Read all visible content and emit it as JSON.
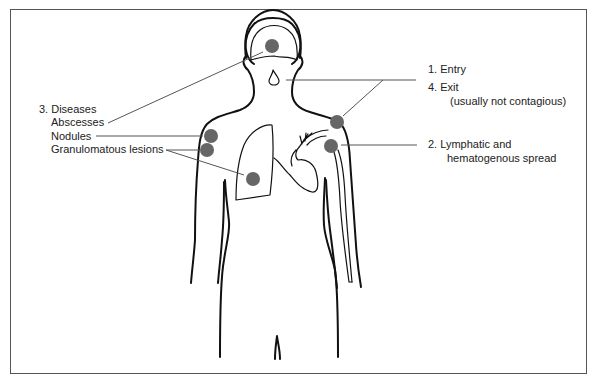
{
  "diagram": {
    "type": "anatomical-infection-route",
    "colors": {
      "lesion": "#666666",
      "outline": "#111111",
      "leader_line": "#555555",
      "frame": "#555555"
    },
    "labels": {
      "entry": "1. Entry",
      "exit": "4. Exit",
      "exit_note": "(usually not contagious)",
      "spread_line1": "2. Lymphatic and",
      "spread_line2": "hematogenous spread",
      "diseases": "3. Diseases",
      "abscesses": "Abscesses",
      "nodules": "Nodules",
      "granulomatous": "Granulomatous lesions"
    },
    "lesion_sites": [
      {
        "name": "brain",
        "x": 272,
        "y": 46
      },
      {
        "name": "right-shoulder-skin",
        "x": 337,
        "y": 122
      },
      {
        "name": "lymph-node",
        "x": 331,
        "y": 146
      },
      {
        "name": "left-shoulder-nodule",
        "x": 211,
        "y": 136
      },
      {
        "name": "left-arm-lesion",
        "x": 207,
        "y": 150
      },
      {
        "name": "lung",
        "x": 253,
        "y": 179
      }
    ]
  }
}
